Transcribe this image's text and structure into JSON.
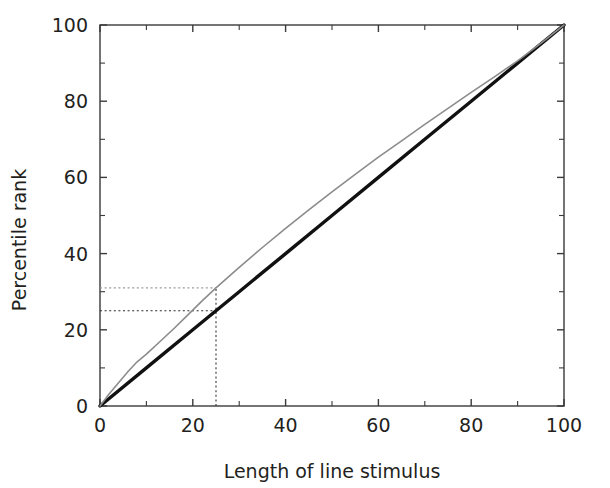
{
  "chart_data": {
    "type": "line",
    "title": "",
    "xlabel": "Length of line stimulus",
    "ylabel": "Percentile rank",
    "xlim": [
      0,
      100
    ],
    "ylim": [
      0,
      100
    ],
    "grid": false,
    "legend": "none",
    "x_ticks": [
      0,
      20,
      40,
      60,
      80,
      100
    ],
    "y_ticks": [
      0,
      20,
      40,
      60,
      80,
      100
    ],
    "x_tick_labels": [
      "0",
      "20",
      "40",
      "60",
      "80",
      "100"
    ],
    "y_tick_labels": [
      "0",
      "20",
      "40",
      "60",
      "80",
      "100"
    ],
    "x_minor_ticks": [
      10,
      30,
      50,
      70,
      90
    ],
    "y_minor_ticks": [
      10,
      30,
      50,
      70,
      90
    ],
    "series": [
      {
        "name": "Identity (linear reference)",
        "style": "solid",
        "color": "#111111",
        "width": 3.4,
        "x": [
          0,
          10,
          20,
          30,
          40,
          50,
          60,
          70,
          80,
          90,
          100
        ],
        "values": [
          0,
          10,
          20,
          30,
          40,
          50,
          60,
          70,
          80,
          90,
          100
        ]
      },
      {
        "name": "Observed percentile rank",
        "style": "solid",
        "color": "#8c8c8c",
        "width": 1.6,
        "x": [
          0,
          2,
          4,
          6,
          8,
          10,
          13,
          16,
          19,
          22,
          25,
          30,
          35,
          40,
          45,
          50,
          55,
          60,
          65,
          70,
          75,
          80,
          85,
          90,
          95,
          100
        ],
        "values": [
          0,
          3.2,
          6.1,
          9.0,
          11.6,
          13.6,
          17.0,
          20.4,
          24.0,
          27.6,
          31.0,
          36.4,
          41.6,
          46.6,
          51.5,
          56.2,
          60.8,
          65.3,
          69.6,
          73.9,
          78.1,
          82.3,
          86.4,
          90.6,
          95.2,
          100
        ]
      }
    ],
    "annotations": [
      {
        "name": "vertical-guide",
        "orientation": "vertical",
        "x": 25,
        "y_from": 0,
        "y_to": 31,
        "style": "dashed",
        "color": "#444444"
      },
      {
        "name": "horizontal-guide-upper",
        "orientation": "horizontal",
        "y": 31,
        "x_from": 0,
        "x_to": 25,
        "style": "dashed",
        "color": "#9a9a9a"
      },
      {
        "name": "horizontal-guide-lower",
        "orientation": "horizontal",
        "y": 25,
        "x_from": 0,
        "x_to": 25,
        "style": "dashed",
        "color": "#2a2a2a"
      }
    ]
  },
  "colors": {
    "background": "#ffffff",
    "axis": "#3a3a3a",
    "text": "#231f20",
    "reference_line": "#111111",
    "data_curve": "#8c8c8c"
  }
}
